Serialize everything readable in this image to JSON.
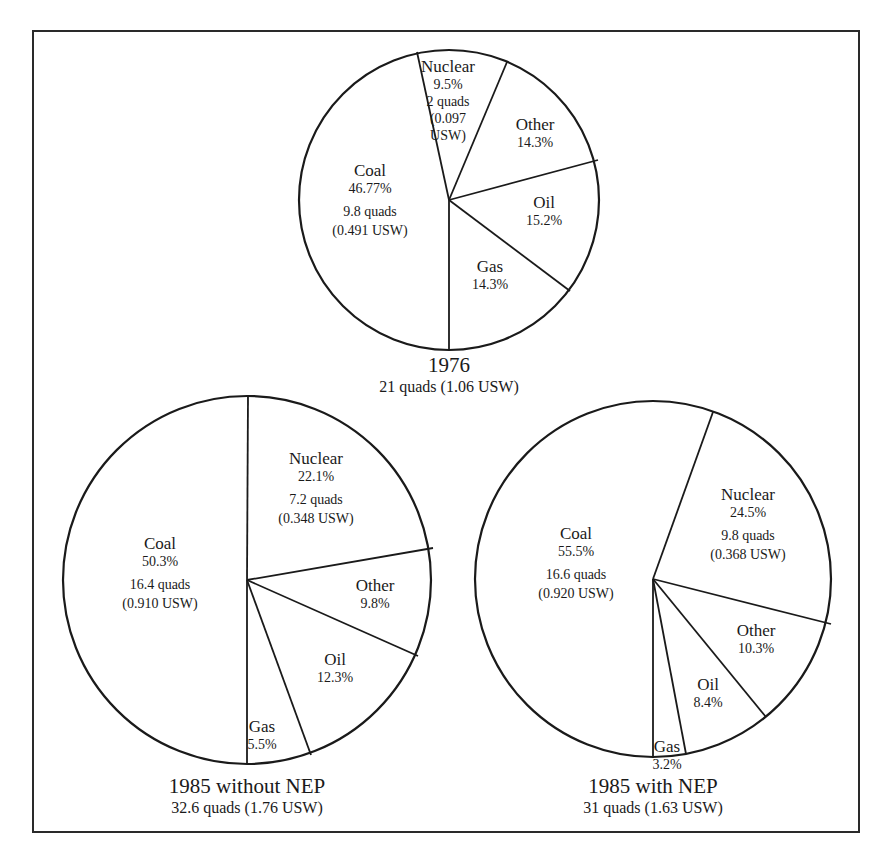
{
  "chart_data": [
    {
      "type": "pie",
      "title": "1976",
      "subtitle": "21 quads (1.06 USW)",
      "categories": [
        "Nuclear",
        "Other",
        "Oil",
        "Gas",
        "Coal"
      ],
      "values": [
        9.5,
        14.3,
        15.2,
        14.3,
        46.77
      ],
      "labels": [
        {
          "name": "Nuclear",
          "lines": [
            "9.5%",
            "2 quads",
            "(0.097",
            "USW)"
          ]
        },
        {
          "name": "Other",
          "lines": [
            "14.3%"
          ]
        },
        {
          "name": "Oil",
          "lines": [
            "15.2%"
          ]
        },
        {
          "name": "Gas",
          "lines": [
            "14.3%"
          ]
        },
        {
          "name": "Coal",
          "lines": [
            "46.77%",
            "9.8 quads",
            "(0.491 USW)"
          ]
        }
      ],
      "geometry": {
        "cx": 449,
        "cy": 200,
        "r": 150,
        "spokes": [
          [
            417,
            52
          ],
          [
            507,
            62
          ],
          [
            598,
            160
          ],
          [
            570,
            291
          ],
          [
            449,
            350
          ]
        ],
        "label_pos": [
          [
            448,
            72
          ],
          [
            535,
            130
          ],
          [
            544,
            208
          ],
          [
            490,
            272
          ],
          [
            370,
            176
          ]
        ]
      }
    },
    {
      "type": "pie",
      "title": "1985 without NEP",
      "subtitle": "32.6 quads (1.76 USW)",
      "categories": [
        "Coal",
        "Nuclear",
        "Other",
        "Oil",
        "Gas"
      ],
      "values": [
        50.3,
        22.1,
        9.8,
        12.3,
        5.5
      ],
      "labels": [
        {
          "name": "Coal",
          "lines": [
            "50.3%",
            "16.4 quads",
            "(0.910 USW)"
          ]
        },
        {
          "name": "Nuclear",
          "lines": [
            "22.1%",
            "7.2 quads",
            "(0.348 USW)"
          ]
        },
        {
          "name": "Other",
          "lines": [
            "9.8%"
          ]
        },
        {
          "name": "Oil",
          "lines": [
            "12.3%"
          ]
        },
        {
          "name": "Gas",
          "lines": [
            "5.5%"
          ]
        }
      ],
      "geometry": {
        "cx": 247,
        "cy": 580,
        "r": 184,
        "spokes": [
          [
            248,
            396
          ],
          [
            433,
            548
          ],
          [
            418,
            656
          ],
          [
            311,
            755
          ],
          [
            247,
            764
          ]
        ],
        "label_pos": [
          [
            160,
            549
          ],
          [
            316,
            464
          ],
          [
            375,
            591
          ],
          [
            335,
            665
          ],
          [
            262,
            732
          ]
        ]
      }
    },
    {
      "type": "pie",
      "title": "1985 with NEP",
      "subtitle": "31 quads (1.63 USW)",
      "categories": [
        "Coal",
        "Nuclear",
        "Other",
        "Oil",
        "Gas"
      ],
      "values": [
        55.5,
        24.5,
        10.3,
        8.4,
        3.2
      ],
      "labels": [
        {
          "name": "Coal",
          "lines": [
            "55.5%",
            "16.6 quads",
            "(0.920 USW)"
          ]
        },
        {
          "name": "Nuclear",
          "lines": [
            "24.5%",
            "9.8 quads",
            "(0.368 USW)"
          ]
        },
        {
          "name": "Other",
          "lines": [
            "10.3%"
          ]
        },
        {
          "name": "Oil",
          "lines": [
            "8.4%"
          ]
        },
        {
          "name": "Gas",
          "lines": [
            "3.2%"
          ]
        }
      ],
      "geometry": {
        "cx": 653,
        "cy": 579,
        "r": 178,
        "spokes": [
          [
            713,
            412
          ],
          [
            831,
            624
          ],
          [
            766,
            717
          ],
          [
            686,
            754
          ],
          [
            653,
            757
          ]
        ],
        "label_pos": [
          [
            576,
            539
          ],
          [
            748,
            500
          ],
          [
            756,
            636
          ],
          [
            708,
            690
          ],
          [
            667,
            752
          ]
        ]
      }
    }
  ]
}
